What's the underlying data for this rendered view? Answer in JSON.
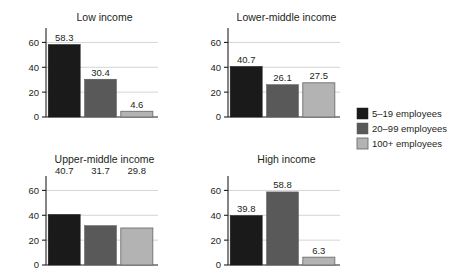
{
  "chart_data": {
    "type": "bar",
    "title": "",
    "xlabel": "",
    "ylabel": "",
    "ylim": [
      0,
      70
    ],
    "yticks": [
      0,
      20,
      40,
      60
    ],
    "grid": true,
    "legend_position": "right",
    "series": [
      {
        "name": "5–19 employees",
        "color": "#1a1a1a"
      },
      {
        "name": "20–99 employees",
        "color": "#595959"
      },
      {
        "name": "100+ employees",
        "color": "#b3b3b3"
      }
    ],
    "panels": [
      {
        "title": "Low income",
        "categories": [
          "5–19 employees",
          "20–99 employees",
          "100+ employees"
        ],
        "values": [
          58.3,
          30.4,
          4.6
        ],
        "labels": [
          "58.3",
          "30.4",
          "4.6"
        ],
        "labels_above_bars": true
      },
      {
        "title": "Lower-middle income",
        "categories": [
          "5–19 employees",
          "20–99 employees",
          "100+ employees"
        ],
        "values": [
          40.7,
          26.1,
          27.5
        ],
        "labels": [
          "40.7",
          "26.1",
          "27.5"
        ],
        "labels_above_bars": true
      },
      {
        "title": "Upper-middle income",
        "categories": [
          "5–19 employees",
          "20–99 employees",
          "100+ employees"
        ],
        "values": [
          40.7,
          31.7,
          29.8
        ],
        "labels": [
          "40.7",
          "31.7",
          "29.8"
        ],
        "labels_above_bars": false
      },
      {
        "title": "High income",
        "categories": [
          "5–19 employees",
          "20–99 employees",
          "100+ employees"
        ],
        "values": [
          39.8,
          58.8,
          6.3
        ],
        "labels": [
          "39.8",
          "58.8",
          "6.3"
        ],
        "labels_above_bars": true
      }
    ]
  },
  "legend": {
    "items": [
      {
        "label": "5–19 employees",
        "color": "#1a1a1a"
      },
      {
        "label": "20–99 employees",
        "color": "#595959"
      },
      {
        "label": "100+ employees",
        "color": "#b3b3b3"
      }
    ]
  },
  "axis": {
    "tick_labels": [
      "0",
      "20",
      "40",
      "60"
    ]
  }
}
